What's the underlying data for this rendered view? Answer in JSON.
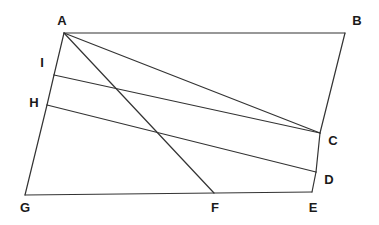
{
  "figure": {
    "kind": "geometry-diagram",
    "width": 379,
    "height": 225,
    "background_color": "#ffffff",
    "stroke_color": "#333333",
    "stroke_width": 1.2,
    "label_color": "#1a1a1a"
  },
  "points": {
    "A": {
      "label": "A",
      "x": 64,
      "y": 33,
      "label_x": 62,
      "label_y": 20
    },
    "B": {
      "label": "B",
      "x": 345,
      "y": 33,
      "label_x": 357,
      "label_y": 20
    },
    "C": {
      "label": "C",
      "x": 320,
      "y": 133,
      "label_x": 333,
      "label_y": 140
    },
    "D": {
      "label": "D",
      "x": 316,
      "y": 172,
      "label_x": 329,
      "label_y": 179
    },
    "E": {
      "label": "E",
      "x": 312,
      "y": 192,
      "label_x": 313,
      "label_y": 207
    },
    "F": {
      "label": "F",
      "x": 214,
      "y": 193,
      "label_x": 215,
      "label_y": 207
    },
    "G": {
      "label": "G",
      "x": 25,
      "y": 195,
      "label_x": 25,
      "label_y": 207
    },
    "H": {
      "label": "H",
      "x": 47,
      "y": 105,
      "label_x": 34,
      "label_y": 102
    },
    "I": {
      "label": "I",
      "x": 54,
      "y": 75,
      "label_x": 42,
      "label_y": 62
    }
  },
  "segments": [
    {
      "name": "segment-AB",
      "from": "A",
      "to": "B"
    },
    {
      "name": "segment-BC",
      "from": "B",
      "to": "C"
    },
    {
      "name": "segment-CD",
      "from": "C",
      "to": "D"
    },
    {
      "name": "segment-DE",
      "from": "D",
      "to": "E"
    },
    {
      "name": "segment-EG",
      "from": "E",
      "to": "G"
    },
    {
      "name": "segment-GH",
      "from": "G",
      "to": "H"
    },
    {
      "name": "segment-HI",
      "from": "H",
      "to": "I"
    },
    {
      "name": "segment-IA",
      "from": "I",
      "to": "A"
    },
    {
      "name": "segment-AF",
      "from": "A",
      "to": "F"
    },
    {
      "name": "segment-AC",
      "from": "A",
      "to": "C"
    },
    {
      "name": "segment-IC",
      "from": "I",
      "to": "C"
    },
    {
      "name": "segment-HD",
      "from": "H",
      "to": "D"
    }
  ],
  "label_order": [
    "A",
    "B",
    "C",
    "D",
    "E",
    "F",
    "G",
    "H",
    "I"
  ]
}
